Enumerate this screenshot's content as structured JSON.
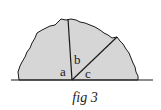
{
  "figure": {
    "caption": "fig 3",
    "labels": {
      "a": "a",
      "b": "b",
      "c": "c"
    },
    "colors": {
      "fill": "#d6d6d6",
      "stroke": "#1a1a1a",
      "background": "#ffffff"
    }
  }
}
